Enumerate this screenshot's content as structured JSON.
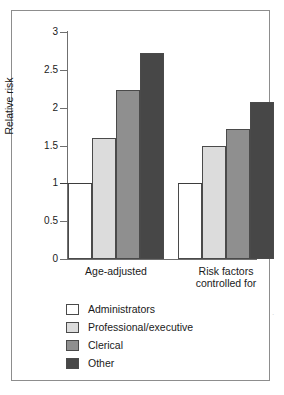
{
  "figure": {
    "background_color": "#ffffff",
    "frame_color": "#8d8d8d",
    "axis_color": "#6f6f6f"
  },
  "chart_data": {
    "type": "bar",
    "title": "",
    "xlabel": "",
    "ylabel": "Relative risk",
    "categories": [
      "Age-adjusted",
      "Risk factors controlled for"
    ],
    "category_labels_multiline": [
      [
        "Age-adjusted"
      ],
      [
        "Risk factors",
        "controlled for"
      ]
    ],
    "series": [
      {
        "name": "Administrators",
        "values": [
          1,
          1
        ],
        "color": "#ffffff"
      },
      {
        "name": "Professional/executive",
        "values": [
          1.6,
          1.5
        ],
        "color": "#dcdcdc"
      },
      {
        "name": "Clerical",
        "values": [
          2.24,
          1.72
        ],
        "color": "#8f8f8f"
      },
      {
        "name": "Other",
        "values": [
          2.72,
          2.08
        ],
        "color": "#474747"
      }
    ],
    "ylim": [
      0,
      3
    ],
    "yticks": [
      0,
      0.5,
      1,
      1.5,
      2,
      2.5,
      3
    ],
    "ytick_labels": [
      "0",
      "0.5",
      "1",
      "1.5",
      "2",
      "2.5",
      "3"
    ],
    "grid": false,
    "legend_position": "below-axes",
    "reference_line": {
      "value": 1,
      "label": ""
    },
    "bar_edge_color": "#4a4a4a"
  },
  "legend": {
    "items": [
      {
        "label": "Administrators",
        "color": "#ffffff"
      },
      {
        "label": "Professional/executive",
        "color": "#dcdcdc"
      },
      {
        "label": "Clerical",
        "color": "#8f8f8f"
      },
      {
        "label": "Other",
        "color": "#474747"
      }
    ]
  }
}
